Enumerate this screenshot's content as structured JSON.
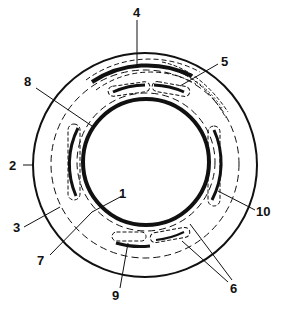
{
  "diagram": {
    "type": "cross-section",
    "colors": {
      "stroke": "#111111",
      "background": "#ffffff"
    },
    "labels": [
      {
        "id": "1",
        "text": "1"
      },
      {
        "id": "2",
        "text": "2"
      },
      {
        "id": "3",
        "text": "3"
      },
      {
        "id": "4",
        "text": "4"
      },
      {
        "id": "5",
        "text": "5"
      },
      {
        "id": "6",
        "text": "6"
      },
      {
        "id": "7",
        "text": "7"
      },
      {
        "id": "8",
        "text": "8"
      },
      {
        "id": "9",
        "text": "9"
      },
      {
        "id": "10",
        "text": "10"
      }
    ]
  }
}
